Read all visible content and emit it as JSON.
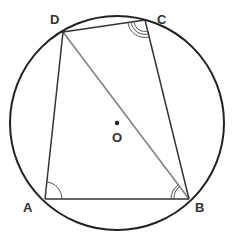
{
  "diagram": {
    "type": "cyclic-quadrilateral",
    "circle": {
      "center_label": "O",
      "cx": 117,
      "cy": 123,
      "r": 107
    },
    "points": {
      "A": {
        "label": "A",
        "x": 45,
        "y": 199
      },
      "B": {
        "label": "B",
        "x": 189,
        "y": 199
      },
      "C": {
        "label": "C",
        "x": 145,
        "y": 20
      },
      "D": {
        "label": "D",
        "x": 63,
        "y": 32
      }
    },
    "segments": [
      "AB",
      "BC",
      "CD",
      "DA",
      "DB"
    ],
    "diagonal": "DB",
    "angle_marks": [
      {
        "vertex": "A",
        "arcs": 1
      },
      {
        "vertex": "B",
        "arcs": 2
      },
      {
        "vertex": "C",
        "arcs": 3
      }
    ],
    "colors": {
      "stroke": "#222222",
      "diagonal": "#888888",
      "label": "#333333"
    }
  }
}
